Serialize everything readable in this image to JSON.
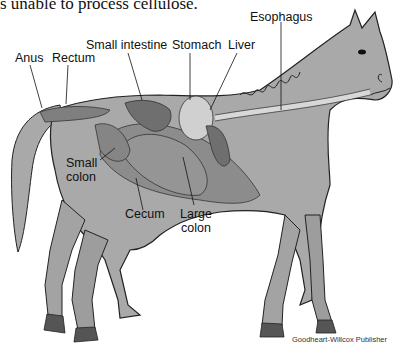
{
  "header": {
    "partial_sentence": "s unable to process cellulose."
  },
  "diagram": {
    "labels": [
      {
        "id": "esophagus",
        "text": "Esophagus"
      },
      {
        "id": "small-intestine",
        "text": "Small intestine"
      },
      {
        "id": "stomach",
        "text": "Stomach"
      },
      {
        "id": "liver",
        "text": "Liver"
      },
      {
        "id": "anus",
        "text": "Anus"
      },
      {
        "id": "rectum",
        "text": "Rectum"
      },
      {
        "id": "small-colon-line1",
        "text": "Small"
      },
      {
        "id": "small-colon-line2",
        "text": "colon"
      },
      {
        "id": "cecum",
        "text": "Cecum"
      },
      {
        "id": "large-colon-line1",
        "text": "Large"
      },
      {
        "id": "large-colon-line2",
        "text": "colon"
      }
    ],
    "colors": {
      "body": "#a9a9a9",
      "outline": "#222222",
      "organ_dark": "#6f6f6f",
      "organ_mid": "#8c8c8c",
      "stomach": "#d0d0d0",
      "hoof": "#555555"
    }
  },
  "footer": {
    "credit": "Goodheart-Willcox Publisher"
  }
}
